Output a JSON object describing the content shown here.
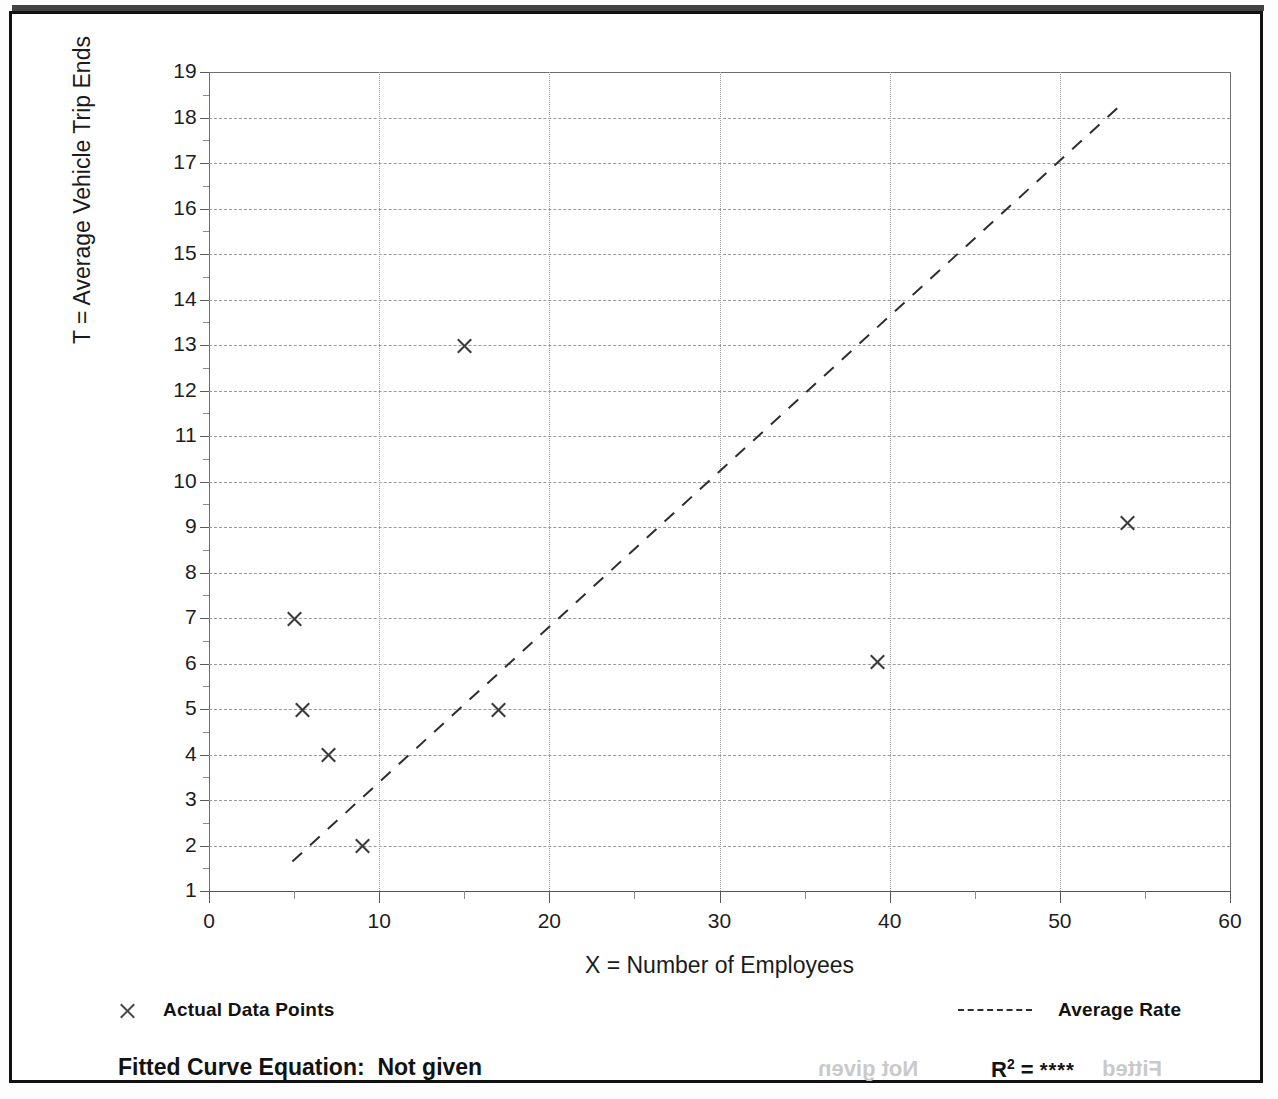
{
  "chart_data": {
    "type": "scatter",
    "title": "",
    "xlabel": "X = Number of Employees",
    "ylabel": "T = Average Vehicle Trip Ends",
    "xlim": [
      0,
      60
    ],
    "ylim": [
      1,
      19
    ],
    "grid": true,
    "x_ticks": [
      0,
      10,
      20,
      30,
      40,
      50,
      60
    ],
    "x_tick_labels": [
      "0",
      "10",
      "20",
      "30",
      "40",
      "50",
      "60"
    ],
    "x_minor_ticks": [
      5,
      15,
      25,
      35,
      45,
      55
    ],
    "y_ticks": [
      1,
      2,
      3,
      4,
      5,
      6,
      7,
      8,
      9,
      10,
      11,
      12,
      13,
      14,
      15,
      16,
      17,
      18,
      19
    ],
    "y_tick_labels": [
      "1",
      "2",
      "3",
      "4",
      "5",
      "6",
      "7",
      "8",
      "9",
      "10",
      "11",
      "12",
      "13",
      "14",
      "15",
      "16",
      "17",
      "18",
      "19"
    ],
    "y_minor_ticks": [
      1.5,
      2.5,
      3.5,
      4.5,
      5.5,
      6.5,
      7.5,
      8.5,
      9.5,
      10.5,
      11.5,
      12.5,
      13.5,
      14.5,
      15.5,
      16.5,
      17.5,
      18.5
    ],
    "legend_position": "below-axes",
    "series": [
      {
        "name": "Actual Data Points",
        "type": "scatter",
        "marker": "x",
        "color": "#3a3a3a",
        "points": [
          {
            "x": 5.0,
            "y": 7.0
          },
          {
            "x": 5.5,
            "y": 5.0
          },
          {
            "x": 7.0,
            "y": 4.0
          },
          {
            "x": 9.0,
            "y": 2.0
          },
          {
            "x": 15.0,
            "y": 13.0
          },
          {
            "x": 17.0,
            "y": 5.0
          },
          {
            "x": 39.3,
            "y": 6.05
          },
          {
            "x": 54.0,
            "y": 9.1
          }
        ]
      },
      {
        "name": "Average Rate",
        "type": "line",
        "style": "dashed",
        "color": "#2e2e2e",
        "points": [
          {
            "x": 4.9,
            "y": 1.65
          },
          {
            "x": 53.8,
            "y": 18.35
          }
        ]
      }
    ],
    "annotations": [
      {
        "name": "fitted-curve-equation",
        "text": "Fitted Curve Equation:  Not given"
      },
      {
        "name": "r-squared",
        "text": "R2 = ****"
      }
    ]
  },
  "axes": {
    "y_title": "T = Average Vehicle Trip Ends",
    "x_title": "X = Number of Employees"
  },
  "legend": {
    "points_label": "Actual Data Points",
    "line_label": "Average Rate",
    "point_icon": "x-marker-icon",
    "line_icon": "dashed-line-icon"
  },
  "footnotes": {
    "fit_equation": "Fitted Curve Equation:  Not given",
    "r_label": "R",
    "r_exponent": "2",
    "r_equals": " = ",
    "r_value": "****"
  },
  "bleed_through": {
    "left_text": "Not given",
    "right_text": "Fitted"
  },
  "colors": {
    "marker": "#3a3a3a",
    "trend_line": "#2e2e2e",
    "grid": "#9a9a9a",
    "axis": "#5a5a5a",
    "text": "#1a1a1a",
    "frame": "#111111",
    "background": "#ffffff"
  }
}
